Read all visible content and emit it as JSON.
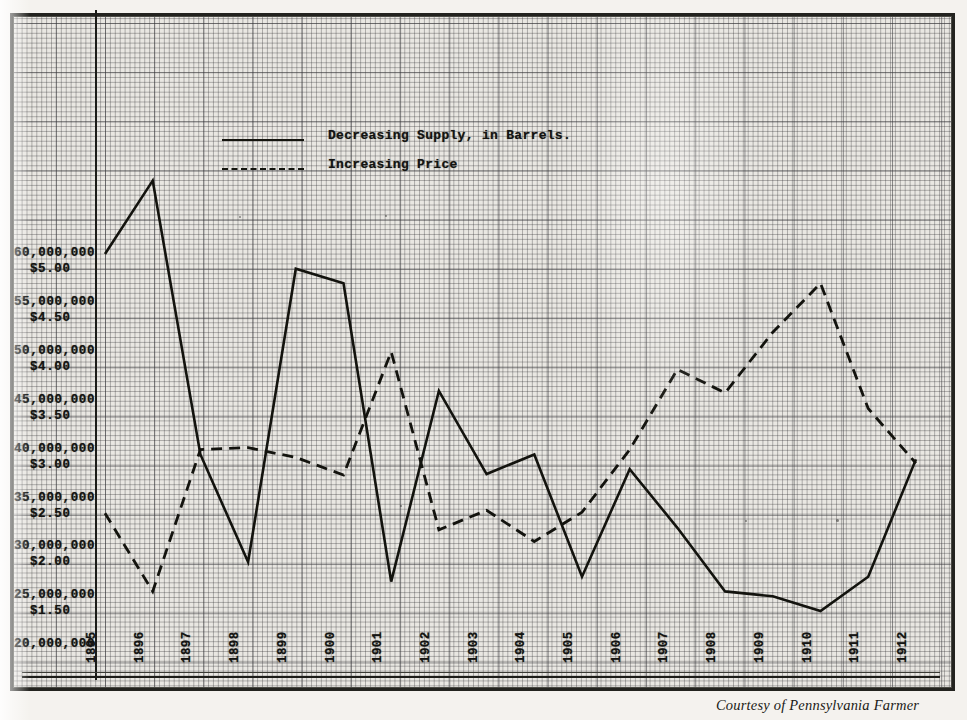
{
  "caption": "Courtesy of Pennsylvania Farmer",
  "legend": [
    {
      "key": "solid",
      "label": "Decreasing Supply, in Barrels."
    },
    {
      "key": "dashed",
      "label": "Increasing Price"
    }
  ],
  "y_axis_labels": [
    {
      "barrels": "60,000,000",
      "price": "$5.00"
    },
    {
      "barrels": "55,000,000",
      "price": "$4.50"
    },
    {
      "barrels": "50,000,000",
      "price": "$4.00"
    },
    {
      "barrels": "45,000,000",
      "price": "$3.50"
    },
    {
      "barrels": "40,000,000",
      "price": "$3.00"
    },
    {
      "barrels": "35,000,000",
      "price": "$2.50"
    },
    {
      "barrels": "30,000,000",
      "price": "$2.00"
    },
    {
      "barrels": "25,000,000",
      "price": "$1.50"
    },
    {
      "barrels": "20,000,000",
      "price": ""
    }
  ],
  "chart_data": {
    "type": "line",
    "title": "",
    "xlabel": "",
    "ylabel": "Barrels / Price per Barrel",
    "grid": true,
    "legend_position": "top-left",
    "categories": [
      "1895",
      "1896",
      "1897",
      "1898",
      "1899",
      "1900",
      "1901",
      "1902",
      "1903",
      "1904",
      "1905",
      "1906",
      "1907",
      "1908",
      "1909",
      "1910",
      "1911",
      "1912"
    ],
    "y_left": {
      "label": "Supply, in Barrels",
      "ticks": [
        20000000,
        25000000,
        30000000,
        35000000,
        40000000,
        45000000,
        50000000,
        55000000,
        60000000
      ],
      "ylim": [
        20000000,
        62000000
      ]
    },
    "y_right": {
      "label": "Price per Barrel",
      "ticks": [
        1.5,
        2.0,
        2.5,
        3.0,
        3.5,
        4.0,
        4.5,
        5.0
      ],
      "ylim": [
        1.3,
        5.2
      ]
    },
    "series": [
      {
        "name": "Decreasing Supply, in Barrels.",
        "style": "solid",
        "axis": "left",
        "values": [
          60000000,
          67500000,
          39500000,
          28500000,
          58500000,
          57000000,
          26500000,
          46000000,
          37500000,
          39500000,
          27000000,
          38000000,
          32000000,
          25500000,
          25000000,
          23500000,
          27000000,
          39000000
        ]
      },
      {
        "name": "Increasing Price",
        "style": "dashed",
        "axis": "right",
        "values": [
          2.35,
          1.55,
          3.0,
          3.02,
          2.92,
          2.74,
          4.0,
          2.18,
          2.38,
          2.06,
          2.36,
          3.0,
          3.82,
          3.58,
          4.2,
          4.7,
          3.42,
          2.86
        ]
      }
    ]
  }
}
